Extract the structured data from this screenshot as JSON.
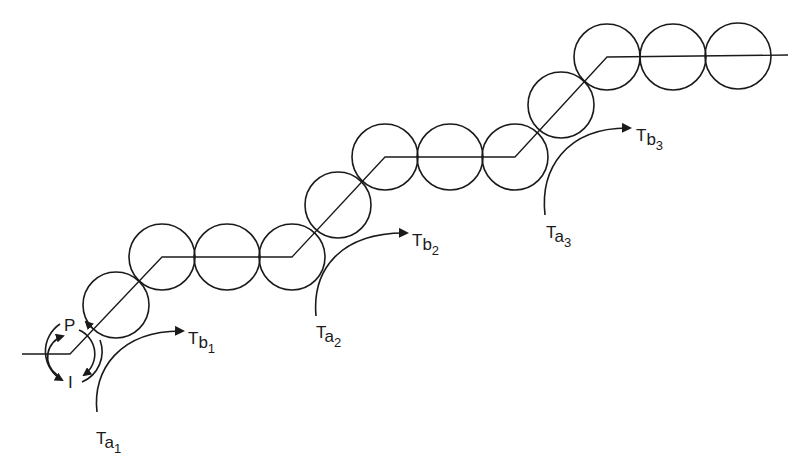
{
  "diagram": {
    "colors": {
      "line": "#1a1a1a",
      "background": "#ffffff"
    },
    "path_points": [
      [
        22,
        354
      ],
      [
        70,
        354
      ],
      [
        162,
        257
      ],
      [
        292,
        257
      ],
      [
        385,
        157
      ],
      [
        515,
        157
      ],
      [
        607,
        57
      ],
      [
        788,
        55
      ]
    ],
    "circle_radius": 33,
    "circles": [
      {
        "cx": 116,
        "cy": 305
      },
      {
        "cx": 162,
        "cy": 257
      },
      {
        "cx": 227,
        "cy": 257
      },
      {
        "cx": 292,
        "cy": 257
      },
      {
        "cx": 338,
        "cy": 205
      },
      {
        "cx": 385,
        "cy": 157
      },
      {
        "cx": 450,
        "cy": 157
      },
      {
        "cx": 515,
        "cy": 157
      },
      {
        "cx": 561,
        "cy": 105
      },
      {
        "cx": 607,
        "cy": 57
      },
      {
        "cx": 673,
        "cy": 57
      },
      {
        "cx": 738,
        "cy": 56
      }
    ],
    "rotation_indicator": {
      "labels": {
        "top": "P",
        "bottom": "I"
      }
    },
    "transfers": [
      {
        "from_main": "T",
        "from_sub": "a",
        "from_index": "1",
        "to_main": "T",
        "to_sub": "b",
        "to_index": "1"
      },
      {
        "from_main": "T",
        "from_sub": "a",
        "from_index": "2",
        "to_main": "T",
        "to_sub": "b",
        "to_index": "2"
      },
      {
        "from_main": "T",
        "from_sub": "a",
        "from_index": "3",
        "to_main": "T",
        "to_sub": "b",
        "to_index": "3"
      }
    ]
  }
}
